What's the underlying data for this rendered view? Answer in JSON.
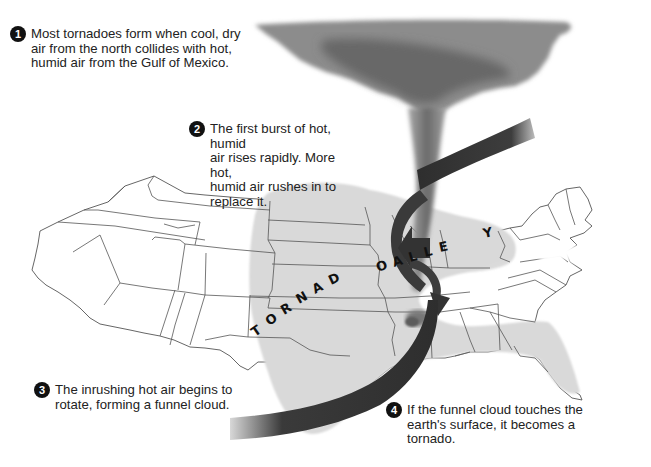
{
  "title": {
    "text": ""
  },
  "steps": [
    {
      "number": "1",
      "text": "Most tornadoes form when cool, dry\nair from the north collides with hot,\nhumid air from the Gulf of Mexico."
    },
    {
      "number": "2",
      "text": "The first burst of hot, humid\nair rises rapidly. More hot,\nhumid air rushes in to\nreplace it."
    },
    {
      "number": "3",
      "text": "The inrushing hot air begins to\nrotate, forming a funnel cloud."
    },
    {
      "number": "4",
      "text": "If the funnel cloud touches the\nearth's surface, it becomes a\ntornado."
    }
  ],
  "map": {
    "region_label": "TORNADO ALLEY",
    "letters": [
      "T",
      "O",
      "R",
      "N",
      "A",
      "D",
      "O",
      "A",
      "L",
      "L",
      "E",
      "Y"
    ]
  },
  "colors": {
    "map_fill": "#ffffff",
    "alley_fill": "#d9d9d9",
    "state_lines": "#555555",
    "cloud": "#8a8a8a",
    "cloud_dark": "#5e5e5e",
    "arrow": "#3a3a3a",
    "badge": "#111111"
  }
}
